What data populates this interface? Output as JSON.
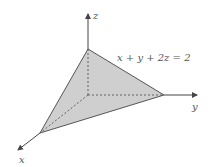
{
  "diagram": {
    "type": "3d-plane-tetrahedron",
    "equation": "x + y + 2z = 2",
    "axes": {
      "x": {
        "label": "x"
      },
      "y": {
        "label": "y"
      },
      "z": {
        "label": "z"
      }
    },
    "colors": {
      "fill": "#cfcfcf",
      "edge": "#555555",
      "axis": "#444444",
      "dashed": "#555555"
    },
    "geometry": {
      "origin": [
        88,
        95
      ],
      "x_vertex": [
        40,
        133
      ],
      "y_vertex": [
        164,
        95
      ],
      "z_vertex": [
        88,
        49
      ],
      "x_axis_end": [
        17,
        151
      ],
      "y_axis_end": [
        198,
        95
      ],
      "z_axis_end": [
        88,
        13
      ]
    }
  }
}
